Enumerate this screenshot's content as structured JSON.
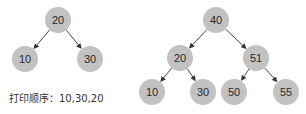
{
  "colors": {
    "node_fill": "#c2c2c2",
    "edge": "#333333",
    "text": "#2a2a2a"
  },
  "left_tree": {
    "nodes": [
      {
        "id": "n20",
        "label": "20",
        "x": 58,
        "y": 20
      },
      {
        "id": "n10",
        "label": "10",
        "x": 25,
        "y": 59
      },
      {
        "id": "n30",
        "label": "30",
        "x": 90,
        "y": 59
      }
    ],
    "edges": [
      [
        "n20",
        "n10"
      ],
      [
        "n20",
        "n30"
      ]
    ],
    "caption": "打印顺序：10,30,20"
  },
  "right_tree": {
    "nodes": [
      {
        "id": "r40",
        "label": "40",
        "x": 216,
        "y": 20
      },
      {
        "id": "r20",
        "label": "20",
        "x": 180,
        "y": 58
      },
      {
        "id": "r51",
        "label": "51",
        "x": 256,
        "y": 58
      },
      {
        "id": "r10",
        "label": "10",
        "x": 152,
        "y": 92
      },
      {
        "id": "r30",
        "label": "30",
        "x": 203,
        "y": 92
      },
      {
        "id": "r50",
        "label": "50",
        "x": 234,
        "y": 92
      },
      {
        "id": "r55",
        "label": "55",
        "x": 286,
        "y": 92
      }
    ],
    "edges": [
      [
        "r40",
        "r20"
      ],
      [
        "r40",
        "r51"
      ],
      [
        "r20",
        "r10"
      ],
      [
        "r20",
        "r30"
      ],
      [
        "r51",
        "r50"
      ],
      [
        "r51",
        "r55"
      ]
    ]
  }
}
